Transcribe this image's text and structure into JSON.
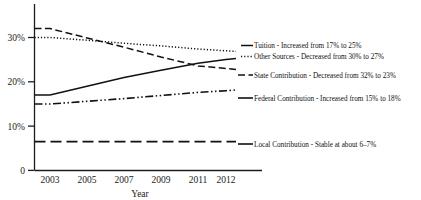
{
  "chart_data": {
    "type": "line",
    "title": "",
    "xlabel": "Year",
    "ylabel": "",
    "grid": false,
    "legend_position": "inline-right-annotations",
    "x": [
      2003,
      2005,
      2007,
      2009,
      2011,
      2012
    ],
    "categories": [
      "2003",
      "2005",
      "2007",
      "2009",
      "2011",
      "2012"
    ],
    "xtick_labels": [
      "2003",
      "2005",
      "2007",
      "2009",
      "2011",
      "2012"
    ],
    "ytick_labels": [
      "0",
      "10%",
      "20%",
      "30%"
    ],
    "ytick_values": [
      0,
      10,
      20,
      30
    ],
    "ylim": [
      0,
      34
    ],
    "series": [
      {
        "name": "Tuition",
        "style": "solid",
        "values": [
          17,
          19,
          21,
          22.6,
          24.2,
          25
        ],
        "annotation": "Tuition - Increased from 17% to 25%"
      },
      {
        "name": "Other Sources",
        "style": "dotted",
        "values": [
          30,
          29.4,
          28.7,
          28.1,
          27.4,
          27
        ],
        "annotation": "Other Sources - Decreased from 30% to 27%"
      },
      {
        "name": "State Contribution",
        "style": "dashed",
        "values": [
          32,
          29.9,
          27.8,
          25.6,
          23.6,
          23
        ],
        "annotation": "State Contribution - Decreased from 32% to 23%"
      },
      {
        "name": "Federal Contribution",
        "style": "dash-dot-dot",
        "values": [
          15,
          15.6,
          16.2,
          16.9,
          17.6,
          18
        ],
        "annotation": "Federal Contribution - Increased from 15% to 18%"
      },
      {
        "name": "Local Contribution",
        "style": "long-dash",
        "values": [
          6.5,
          6.5,
          6.5,
          6.5,
          6.5,
          6.5
        ],
        "annotation": "Local Contribution - Stable at about 6–7%"
      }
    ]
  },
  "axes": {
    "x_title": "Year",
    "y_ticks": [
      {
        "label": "30%"
      },
      {
        "label": "20%"
      },
      {
        "label": "10%"
      },
      {
        "label": "0"
      }
    ],
    "x_ticks": [
      {
        "label": "2003"
      },
      {
        "label": "2005"
      },
      {
        "label": "2007"
      },
      {
        "label": "2009"
      },
      {
        "label": "2011"
      },
      {
        "label": "2012"
      }
    ]
  },
  "annotations": [
    {
      "key": "tuition",
      "text": "Tuition - Increased from 17% to 25%"
    },
    {
      "key": "other_sources",
      "text": "Other Sources - Decreased from 30% to 27%"
    },
    {
      "key": "state",
      "text": "State Contribution - Decreased from 32% to 23%"
    },
    {
      "key": "federal",
      "text": "Federal Contribution - Increased from 15% to 18%"
    },
    {
      "key": "local",
      "text": "Local Contribution - Stable at about 6–7%"
    }
  ],
  "colors": {
    "ink": "#111111",
    "background": "#ffffff"
  }
}
